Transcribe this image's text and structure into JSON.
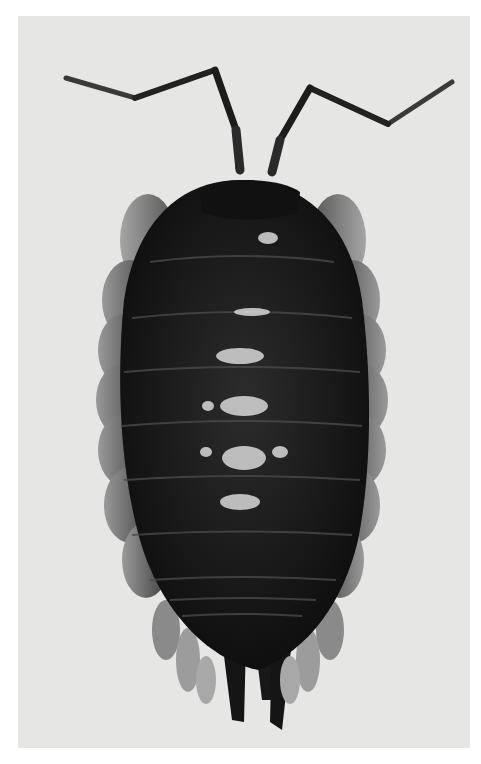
{
  "image": {
    "subject": "isopod (woodlouse), dorsal view",
    "style": "grayscale photograph",
    "colors": {
      "page": "#ffffff",
      "backdrop": "#e6e6e4",
      "body": "#141414",
      "body_mid": "#2a2a2a",
      "pleura": "#6e6e6e",
      "highlight": "#d8d8d8"
    }
  }
}
